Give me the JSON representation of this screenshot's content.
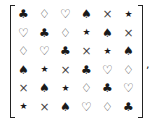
{
  "matrix": {
    "rows": [
      [
        "♣",
        "♢",
        "♡",
        "♠",
        "×",
        "★"
      ],
      [
        "♡",
        "♣",
        "♢",
        "★",
        "♠",
        "×"
      ],
      [
        "♢",
        "♡",
        "♣",
        "×",
        "★",
        "♠"
      ],
      [
        "♠",
        "★",
        "×",
        "♣",
        "♡",
        "♢"
      ],
      [
        "×",
        "♠",
        "★",
        "♢",
        "♣",
        "♡"
      ],
      [
        "★",
        "×",
        "♠",
        "♡",
        "♢",
        "♣"
      ]
    ],
    "trailing_punctuation": ","
  }
}
